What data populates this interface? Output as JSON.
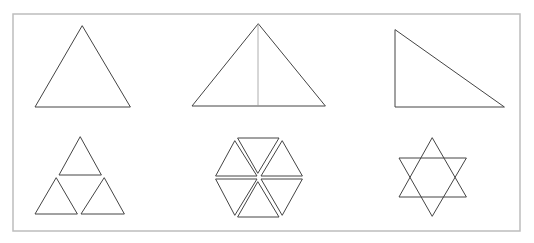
{
  "figure": {
    "colors": {
      "stroke": "#444444",
      "frame": "#bdbdbd",
      "background": "#ffffff"
    },
    "frame": {
      "x": 13,
      "y": 14,
      "w": 507,
      "h": 217
    },
    "shapes": [
      {
        "id": "equilateral-triangle",
        "row": 1,
        "col": 1,
        "points": [
          [
            82,
            26
          ],
          [
            35,
            107
          ],
          [
            130,
            107
          ]
        ]
      },
      {
        "id": "triangle-with-altitude",
        "row": 1,
        "col": 2,
        "points": [
          [
            258,
            24
          ],
          [
            192,
            106
          ],
          [
            325,
            106
          ]
        ],
        "altitude": [
          [
            258,
            24
          ],
          [
            258,
            106
          ]
        ]
      },
      {
        "id": "right-triangle",
        "row": 1,
        "col": 3,
        "points": [
          [
            395,
            30
          ],
          [
            395,
            107
          ],
          [
            504,
            107
          ]
        ]
      },
      {
        "id": "three-triangles-pyramid",
        "row": 2,
        "col": 1,
        "triangles": [
          [
            [
              80,
              137
            ],
            [
              59,
              175
            ],
            [
              101,
              175
            ]
          ],
          [
            [
              56,
              178
            ],
            [
              35,
              214
            ],
            [
              77,
              214
            ]
          ],
          [
            [
              104,
              178
            ],
            [
              81,
              214
            ],
            [
              124,
              214
            ]
          ]
        ]
      },
      {
        "id": "hexagon-of-six-triangles",
        "row": 2,
        "col": 2,
        "triangles": [
          [
            [
              238,
              138
            ],
            [
              279,
              138
            ],
            [
              258,
              173
            ]
          ],
          [
            [
              235,
              141
            ],
            [
              257,
              176
            ],
            [
              216,
              176
            ]
          ],
          [
            [
              216,
              179
            ],
            [
              257,
              179
            ],
            [
              235,
              215
            ]
          ],
          [
            [
              258,
              182
            ],
            [
              279,
              217
            ],
            [
              238,
              217
            ]
          ],
          [
            [
              282,
              215
            ],
            [
              261,
              179
            ],
            [
              302,
              179
            ]
          ],
          [
            [
              302,
              176
            ],
            [
              261,
              176
            ],
            [
              282,
              141
            ]
          ]
        ]
      },
      {
        "id": "six-pointed-star",
        "row": 2,
        "col": 3,
        "triangles": [
          [
            [
              432,
              138
            ],
            [
              399,
              197
            ],
            [
              466,
              197
            ]
          ],
          [
            [
              432,
              216
            ],
            [
              399,
              158
            ],
            [
              466,
              158
            ]
          ]
        ]
      }
    ]
  }
}
